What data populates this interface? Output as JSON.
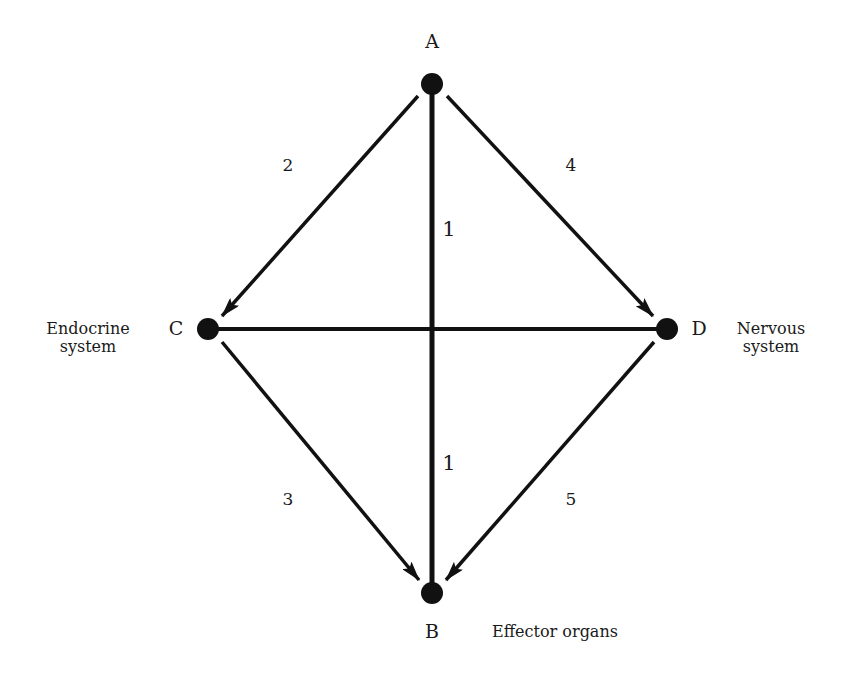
{
  "nodes": {
    "A": {
      "label": "A",
      "x": 432,
      "y": 84,
      "label_x": 432,
      "label_y": 42
    },
    "B": {
      "label": "B",
      "x": 432,
      "y": 593,
      "label_x": 432,
      "label_y": 632
    },
    "C": {
      "label": "C",
      "x": 208,
      "y": 329,
      "label_x": 176,
      "label_y": 329
    },
    "D": {
      "label": "D",
      "x": 667,
      "y": 329,
      "label_x": 699,
      "label_y": 329
    }
  },
  "systems": {
    "endocrine": {
      "line1": "Endocrine",
      "line2": "system",
      "x": 88,
      "y": 338
    },
    "nervous": {
      "line1": "Nervous",
      "line2": "system",
      "x": 771,
      "y": 338
    },
    "effector": {
      "text": "Effector organs",
      "x": 555,
      "y": 632
    }
  },
  "edges": [
    {
      "id": "1-upper",
      "label": "1",
      "from": "A",
      "to": "center",
      "label_x": 449,
      "label_y": 229
    },
    {
      "id": "1-lower",
      "label": "1",
      "from": "center",
      "to": "B",
      "label_x": 449,
      "label_y": 463
    },
    {
      "id": "2",
      "label": "2",
      "from": "A",
      "to": "C",
      "label_x": 288,
      "label_y": 166
    },
    {
      "id": "4",
      "label": "4",
      "from": "A",
      "to": "D",
      "label_x": 571,
      "label_y": 166
    },
    {
      "id": "3",
      "label": "3",
      "from": "C",
      "to": "B",
      "label_x": 288,
      "label_y": 500
    },
    {
      "id": "5",
      "label": "5",
      "from": "D",
      "to": "B",
      "label_x": 571,
      "label_y": 500
    },
    {
      "id": "CD",
      "label": "",
      "from": "C",
      "to": "D"
    }
  ],
  "colors": {
    "ink": "#111111",
    "background": "#ffffff"
  }
}
